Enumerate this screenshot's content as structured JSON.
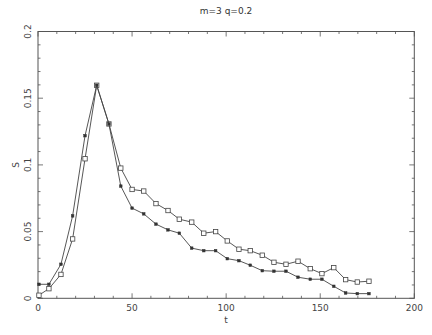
{
  "chart_data": {
    "type": "line",
    "title": "m=3 q=0.2",
    "xlabel": "t",
    "ylabel": "S",
    "xlim": [
      0,
      200
    ],
    "ylim": [
      0,
      0.2
    ],
    "grid": false,
    "legend": null,
    "x_ticks": [
      0,
      50,
      100,
      150,
      200
    ],
    "x_tick_labels": [
      "0",
      "50",
      "100",
      "150",
      "200"
    ],
    "x_minor_step": 10,
    "y_ticks": [
      0,
      0.05,
      0.1,
      0.15,
      0.2
    ],
    "y_tick_labels": [
      "0",
      "0.05",
      "0.1",
      "0.15",
      "0.2"
    ],
    "y_minor_step": 0.01,
    "x": [
      0.5,
      5.8,
      12.2,
      18.4,
      25.0,
      31.2,
      37.7,
      44.0,
      50.0,
      56.2,
      62.7,
      69.1,
      75.1,
      81.7,
      88.1,
      94.4,
      100.6,
      106.8,
      112.8,
      119.2,
      125.4,
      131.8,
      138.2,
      144.7,
      150.9,
      157.2,
      163.5,
      169.7,
      175.9
    ],
    "series": [
      {
        "name": "open-squares",
        "marker": "square-open",
        "values": [
          0.0023,
          0.0072,
          0.0179,
          0.0445,
          0.1046,
          0.1597,
          0.1307,
          0.0976,
          0.0816,
          0.0804,
          0.071,
          0.0658,
          0.0593,
          0.0571,
          0.0488,
          0.05,
          0.043,
          0.0368,
          0.0357,
          0.0323,
          0.027,
          0.0255,
          0.0278,
          0.0222,
          0.0185,
          0.023,
          0.014,
          0.0122,
          0.0128
        ]
      },
      {
        "name": "filled-markers",
        "marker": "square-filled",
        "values": [
          0.0105,
          0.0105,
          0.0255,
          0.0618,
          0.1219,
          0.1597,
          0.1307,
          0.0841,
          0.0676,
          0.0633,
          0.0556,
          0.0513,
          0.0488,
          0.0376,
          0.0357,
          0.0357,
          0.0297,
          0.0282,
          0.0248,
          0.0207,
          0.0203,
          0.0203,
          0.0158,
          0.0143,
          0.0143,
          0.009,
          0.004,
          0.0035,
          0.0035
        ]
      }
    ]
  },
  "colors": {
    "axis": "#555555",
    "line": "#444444",
    "background": "#ffffff"
  }
}
